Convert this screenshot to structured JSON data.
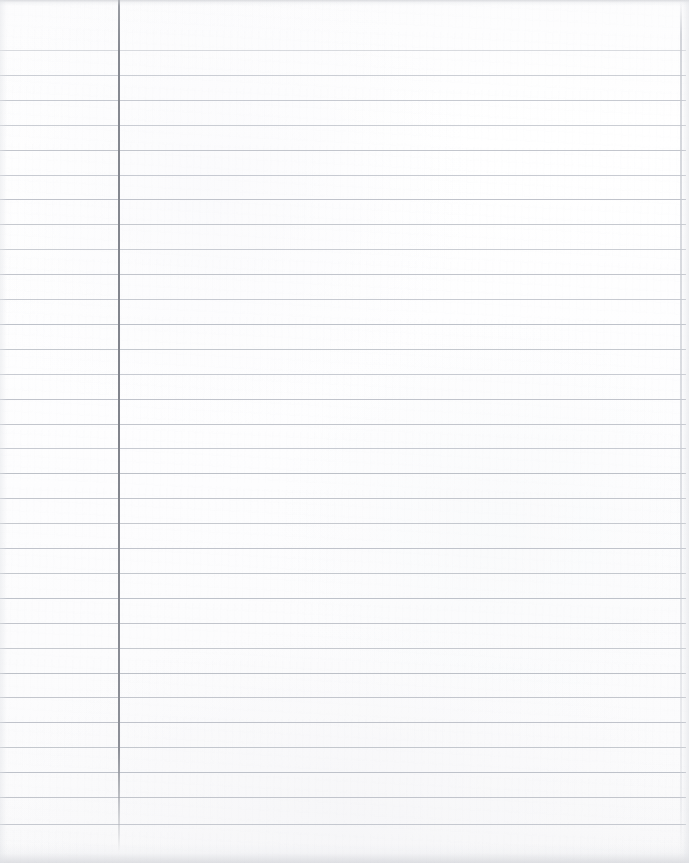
{
  "document": {
    "kind": "ruled-notebook-paper",
    "title": "Blank Ruled Notebook Paper",
    "width_px": 689,
    "height_px": 863,
    "background_color": "#fefefe",
    "content_text": "",
    "is_blank": true
  },
  "ruling": {
    "line_color": "#b9bdc5",
    "line_thickness_px": 1,
    "spacing_px": 24.9,
    "first_line_y": 50,
    "last_line_y": 824,
    "line_count": 32,
    "line_left_x": 0,
    "line_right_x": 686,
    "line_y_positions": [
      50,
      74.9,
      99.8,
      124.7,
      149.6,
      174.5,
      199.4,
      224.3,
      249.2,
      274.1,
      299,
      323.9,
      348.8,
      373.7,
      398.6,
      423.5,
      448.4,
      473.3,
      498.2,
      523.1,
      548,
      572.9,
      597.8,
      622.7,
      647.6,
      672.5,
      697.4,
      722.3,
      747.2,
      772.1,
      797,
      823.9
    ],
    "line_opacities": [
      0.55,
      0.72,
      0.8,
      0.74,
      0.86,
      0.78,
      0.9,
      0.82,
      0.76,
      0.88,
      0.8,
      0.92,
      0.84,
      0.78,
      0.9,
      0.86,
      0.8,
      0.94,
      0.88,
      0.82,
      0.9,
      0.84,
      0.92,
      0.88,
      0.82,
      0.94,
      0.86,
      0.9,
      0.84,
      0.92,
      0.88,
      0.8
    ]
  },
  "margin_rule": {
    "color": "#86898f",
    "x_px": 118,
    "thickness_px": 1.6,
    "top_y": 0,
    "bottom_y": 852
  },
  "paper_edge": {
    "right_edge_x": 680,
    "edge_color": "#c4c7ce",
    "top_shadow_height": 6,
    "bottom_shadow_height": 20
  }
}
